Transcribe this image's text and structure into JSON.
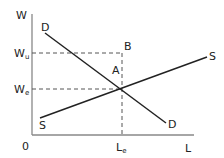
{
  "diagram": {
    "type": "supply-demand-labor-market",
    "axes": {
      "y_label": "W",
      "x_label": "L",
      "origin_label": "0"
    },
    "y_ticks": [
      {
        "label": "W",
        "subscript": "u"
      },
      {
        "label": "W",
        "subscript": "e"
      }
    ],
    "x_ticks": [
      {
        "label": "L",
        "subscript": "e"
      }
    ],
    "curves": {
      "demand": {
        "start_label": "D",
        "end_label": "D"
      },
      "supply": {
        "start_label": "S",
        "end_label": "S"
      }
    },
    "points": {
      "a": "A",
      "b": "B"
    },
    "colors": {
      "line": "#222222",
      "dashed": "#555555",
      "axis": "#888888"
    }
  }
}
